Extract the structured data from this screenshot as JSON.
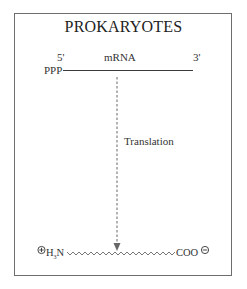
{
  "title": "PROKARYOTES",
  "mrna": {
    "label": "mRNA",
    "five_prime": "5'",
    "three_prime": "3'",
    "cap_label": "PPP"
  },
  "process": {
    "label": "Translation",
    "arrow_style": "dashed"
  },
  "peptide": {
    "n_terminus_charge": "⊕",
    "n_terminus_label": "H",
    "n_terminus_sub": "3",
    "n_terminus_suffix": "N",
    "c_terminus_label": "COO",
    "c_terminus_charge": "⊖"
  },
  "colors": {
    "line": "#4a4a4a",
    "frame": "#6e6e6e",
    "text": "#2a2a2a"
  }
}
